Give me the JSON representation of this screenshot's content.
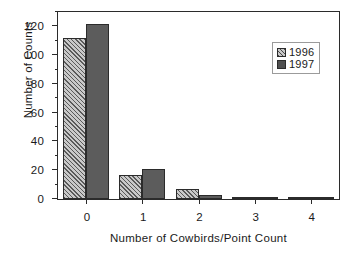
{
  "chart_data": {
    "type": "bar",
    "title": "",
    "xlabel": "Number of Cowbirds/Point Count",
    "ylabel": "Number of Counts",
    "categories": [
      "0",
      "1",
      "2",
      "3",
      "4"
    ],
    "series": [
      {
        "name": "1996",
        "values": [
          112,
          17,
          7,
          1,
          0.5
        ],
        "color": "#c9c9c9",
        "pattern": "diagonal-hatch"
      },
      {
        "name": "1997",
        "values": [
          122,
          21,
          2.5,
          1.5,
          0.5
        ],
        "color": "#5c5c5c",
        "pattern": "solid"
      }
    ],
    "ylim": [
      0,
      130
    ],
    "yticks": [
      0,
      20,
      40,
      60,
      80,
      100,
      120
    ],
    "ytick_labels": [
      "0",
      "20",
      "40",
      "60",
      "80",
      "100",
      "120"
    ],
    "yminor_ticks": [
      10,
      30,
      50,
      70,
      90,
      110,
      130
    ],
    "xtick_labels": [
      "0",
      "1",
      "2",
      "3",
      "4"
    ],
    "grid": false,
    "legend_position": "top-right",
    "legend_entries": [
      "1996",
      "1997"
    ]
  }
}
